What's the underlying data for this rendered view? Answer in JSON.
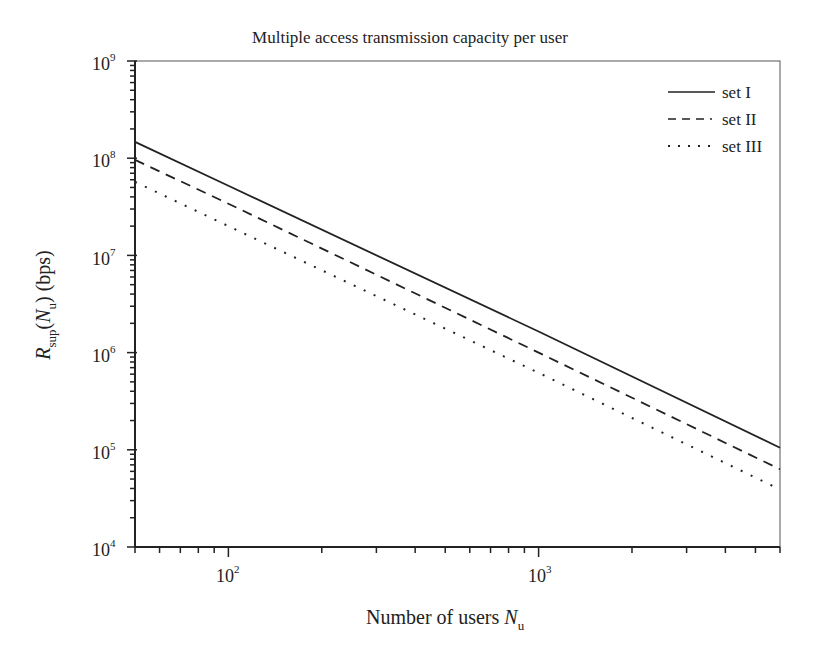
{
  "chart_data": {
    "type": "line",
    "title": "Multiple access transmission capacity per user",
    "xlabel": "Number of users N_u",
    "ylabel": "R_sup(N_u) (bps)",
    "xscale": "log",
    "yscale": "log",
    "xlim": [
      50,
      6000
    ],
    "ylim": [
      10000,
      1000000000
    ],
    "grid": false,
    "legend_position": "upper right",
    "x_ticks": [
      {
        "value": 100,
        "label": "10^2"
      },
      {
        "value": 1000,
        "label": "10^3"
      }
    ],
    "y_ticks": [
      {
        "value": 10000,
        "label": "10^4"
      },
      {
        "value": 100000,
        "label": "10^5"
      },
      {
        "value": 1000000,
        "label": "10^6"
      },
      {
        "value": 10000000,
        "label": "10^7"
      },
      {
        "value": 100000000,
        "label": "10^8"
      },
      {
        "value": 1000000000,
        "label": "10^9"
      }
    ],
    "x": [
      50,
      100,
      1000,
      6000
    ],
    "series": [
      {
        "name": "set I",
        "style": "solid",
        "values": [
          147000000.0,
          52000000.0,
          1650000.0,
          105000.0
        ]
      },
      {
        "name": "set II",
        "style": "dashed",
        "values": [
          96000000.0,
          34000000.0,
          1000000.0,
          63000.0
        ]
      },
      {
        "name": "set III",
        "style": "dotted",
        "values": [
          57000000.0,
          20000000.0,
          620000.0,
          39000.0
        ]
      }
    ]
  },
  "labels": {
    "title": "Multiple access transmission capacity per user",
    "xlabel_main": "Number of users ",
    "xlabel_var": "N",
    "xlabel_sub": "u",
    "ylabel_var": "R",
    "ylabel_sub": "sup",
    "ylabel_paren_open": "(",
    "ylabel_var2": "N",
    "ylabel_sub2": "u",
    "ylabel_rest": ") (bps)",
    "legend": [
      "set I",
      "set II",
      "set III"
    ],
    "x_tick_base": "10",
    "x_tick_exps": [
      "2",
      "3"
    ],
    "y_tick_base": "10",
    "y_tick_exps": [
      "9",
      "8",
      "7",
      "6",
      "5",
      "4"
    ]
  }
}
